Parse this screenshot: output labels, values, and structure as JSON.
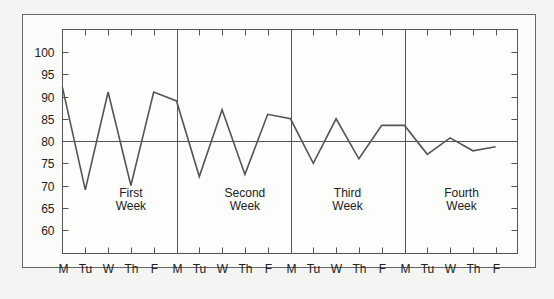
{
  "chart_data": {
    "type": "line",
    "title": "",
    "xlabel": "",
    "ylabel": "",
    "ylim": [
      55,
      104
    ],
    "yticks": [
      60,
      65,
      70,
      75,
      80,
      85,
      90,
      95,
      100
    ],
    "grid": false,
    "legend": null,
    "reference_line": {
      "y": 80
    },
    "categories": [
      "M",
      "Tu",
      "W",
      "Th",
      "F",
      "M",
      "Tu",
      "W",
      "Th",
      "F",
      "M",
      "Tu",
      "W",
      "Th",
      "F",
      "M",
      "Tu",
      "W",
      "Th",
      "F"
    ],
    "series": [
      {
        "name": "Daily value",
        "values": [
          92,
          69,
          91,
          70,
          91,
          89,
          72,
          87,
          72.5,
          86,
          85,
          75,
          85,
          76,
          83.5,
          83.5,
          77,
          80.7,
          77.8,
          78.7
        ]
      }
    ],
    "week_separators_at_index": [
      5,
      10,
      15
    ],
    "annotations": [
      {
        "text": [
          "First",
          "Week"
        ],
        "center_index": 3
      },
      {
        "text": [
          "Second",
          "Week"
        ],
        "center_index": 8
      },
      {
        "text": [
          "Third",
          "Week"
        ],
        "center_index": 12.5
      },
      {
        "text": [
          "Fourth",
          "Week"
        ],
        "center_index": 17.5
      }
    ],
    "colors": {
      "line": "#555555",
      "frame": "#555555",
      "background": "#f4f4f2"
    }
  }
}
